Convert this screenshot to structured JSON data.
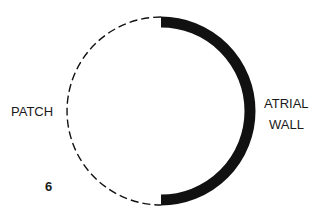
{
  "figure": {
    "number": "6",
    "labels": {
      "left": "PATCH",
      "right_line1": "ATRIAL",
      "right_line2": "WALL"
    },
    "segments": [
      {
        "name": "patch",
        "style": "dashed",
        "portion": "left half"
      },
      {
        "name": "atrial-wall",
        "style": "solid-thick",
        "portion": "right half"
      }
    ],
    "colors": {
      "ink": "#111111",
      "background": "#ffffff"
    }
  }
}
